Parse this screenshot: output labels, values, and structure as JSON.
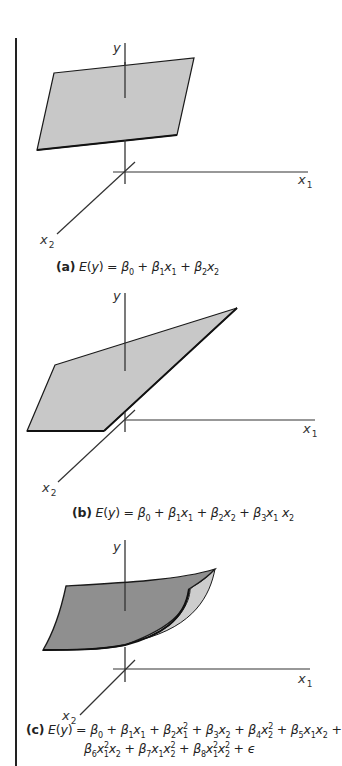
{
  "figure": {
    "panels": [
      {
        "id": "a",
        "axes": {
          "y": "y",
          "x1": "x1",
          "x2": "x2"
        },
        "surface": "plane",
        "caption": {
          "tag": "(a)",
          "lhs": "E(y) =",
          "rhs": "β0 + β1x1 + β2x2",
          "formula_text": "(a) E(y) = β₀ + β₁x₁ + β₂x₂"
        }
      },
      {
        "id": "b",
        "axes": {
          "y": "y",
          "x1": "x1",
          "x2": "x2"
        },
        "surface": "twisted-plane",
        "caption": {
          "tag": "(b)",
          "lhs": "E(y) =",
          "rhs": "β0 + β1x1 + β2x2 + β3x1 x2",
          "formula_text": "(b) E(y) = β₀ + β₁x₁ + β₂x₂ + β₃x₁ x₂"
        }
      },
      {
        "id": "c",
        "axes": {
          "y": "y",
          "x1": "x1",
          "x2": "x2"
        },
        "surface": "curved-surface",
        "caption": {
          "tag": "(c)",
          "lhs": "E(y) =",
          "line1": "β0 + β1x1 + β2x1² + β3x2 + β4x2² + β5x1x2 +",
          "line2": "β6x1²x2 + β7x1x2² + β8x1²x2² + ε",
          "formula_text": "(c) E(y) = β₀ + β₁x₁ + β₂x₁² + β₃x₂ + β₄x₂² + β₅x₁x₂ + β₆x₁²x₂ + β₇x₁x₂² + β₈x₁²x₂² + ε"
        }
      }
    ],
    "colors": {
      "plane_fill": "#c8c8c8",
      "curved_fill_dark": "#8f8f8f",
      "curved_fill_light": "#cdcdcd",
      "stroke": "#1a1a1a",
      "axis": "#333333"
    }
  }
}
